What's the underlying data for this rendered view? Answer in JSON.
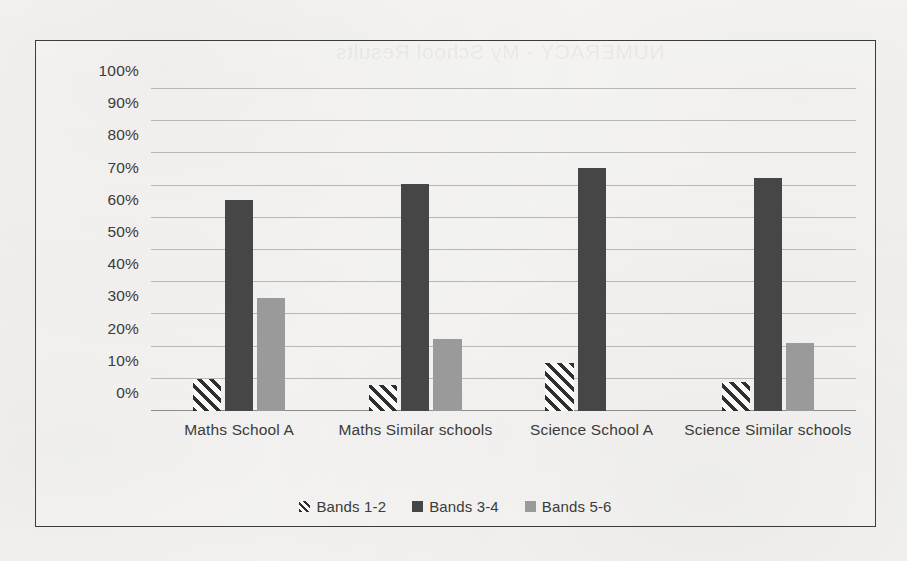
{
  "page": {
    "showthrough_text": "NUMERACY - My School Results"
  },
  "chart_data": {
    "type": "bar",
    "title": "",
    "xlabel": "",
    "ylabel": "",
    "categories": [
      "Maths School A",
      "Maths Similar schools",
      "Science School A",
      "Science Similar schools"
    ],
    "series": [
      {
        "name": "Bands 1-2",
        "color": "#2f2f2f",
        "pattern": "diagonal-hatch",
        "values": [
          10,
          8,
          15,
          9
        ]
      },
      {
        "name": "Bands 3-4",
        "color": "#464646",
        "pattern": "solid",
        "values": [
          65.5,
          70.5,
          75.5,
          72.5
        ]
      },
      {
        "name": "Bands 5-6",
        "color": "#9a9a9a",
        "pattern": "solid",
        "values": [
          35,
          22.5,
          0,
          21
        ]
      }
    ],
    "ylim": [
      0,
      100
    ],
    "ytick_values": [
      0,
      10,
      20,
      30,
      40,
      50,
      60,
      70,
      80,
      90,
      100
    ],
    "ytick_labels": [
      "0%",
      "10%",
      "20%",
      "30%",
      "40%",
      "50%",
      "60%",
      "70%",
      "80%",
      "90%",
      "100%"
    ],
    "grid": true,
    "legend_position": "bottom",
    "legend_entries": [
      "Bands 1-2",
      "Bands 3-4",
      "Bands 5-6"
    ]
  }
}
